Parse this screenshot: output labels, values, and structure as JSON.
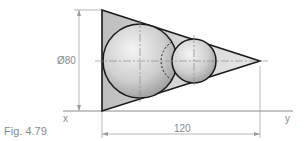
{
  "figure": {
    "caption": "Fig. 4.79",
    "diameter_label": "Ø80",
    "length_label": "120",
    "x_label": "x",
    "y_label": "y"
  },
  "colors": {
    "outline": "#1a1a1a",
    "dimension": "#9a9a9a",
    "fill_triangle": "#c9c9c9",
    "sphere_light": "#f2f2f2",
    "sphere_dark": "#9c9c9c"
  }
}
